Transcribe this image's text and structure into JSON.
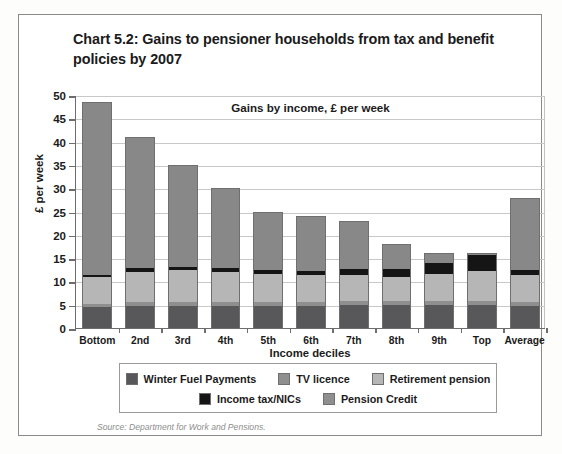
{
  "title": "Chart 5.2: Gains to pensioner households from tax and benefit policies by 2007",
  "source": "Source: Department for Work and Pensions.",
  "chart_data": {
    "type": "bar",
    "stacked": true,
    "title": "Gains by income, £ per week",
    "xlabel": "Income deciles",
    "ylabel": "£ per week",
    "ylim": [
      0,
      50
    ],
    "yticks": [
      0,
      5,
      10,
      15,
      20,
      25,
      30,
      35,
      40,
      45,
      50
    ],
    "ytick_labels": [
      "0",
      "5",
      "10",
      "15",
      "20",
      "25",
      "30",
      "35",
      "40",
      "45",
      "50"
    ],
    "grid": true,
    "legend_position": "below",
    "categories": [
      "Bottom",
      "2nd",
      "3rd",
      "4th",
      "5th",
      "6th",
      "7th",
      "8th",
      "9th",
      "Top",
      "Average"
    ],
    "series": [
      {
        "name": "Winter Fuel Payments",
        "color": "#58585a",
        "values": [
          4.5,
          4.8,
          4.8,
          4.8,
          4.8,
          4.8,
          4.9,
          4.9,
          4.9,
          5.0,
          4.8
        ]
      },
      {
        "name": "TV licence",
        "color": "#8f8f8f",
        "values": [
          0.7,
          0.8,
          0.8,
          0.8,
          0.8,
          0.8,
          0.8,
          0.8,
          0.8,
          0.8,
          0.8
        ]
      },
      {
        "name": "Pension Credit",
        "color": "#b6b6b6",
        "values": [
          5.8,
          6.5,
          6.9,
          6.4,
          5.9,
          5.8,
          5.6,
          5.3,
          5.8,
          6.5,
          5.7
        ]
      },
      {
        "name": "Income tax/NICs",
        "color": "#151515",
        "values": [
          0.3,
          0.7,
          0.7,
          0.9,
          0.9,
          0.9,
          1.3,
          1.6,
          2.4,
          3.4,
          1.1
        ]
      },
      {
        "name": "Retirement pension",
        "color": "#888888",
        "values": [
          37.2,
          28.2,
          21.8,
          17.1,
          12.6,
          11.7,
          10.4,
          5.4,
          2.1,
          0.3,
          15.6
        ]
      }
    ],
    "totals": [
      48.5,
      41.0,
      35.0,
      30.0,
      25.0,
      24.0,
      23.0,
      18.0,
      16.0,
      16.0,
      28.0
    ]
  },
  "legend": {
    "row1": [
      {
        "label": "Winter Fuel Payments",
        "color": "#58585a"
      },
      {
        "label": "TV licence",
        "color": "#8f8f8f"
      },
      {
        "label": "Retirement pension",
        "color": "#b6b6b6"
      }
    ],
    "row2": [
      {
        "label": "Income tax/NICs",
        "color": "#151515"
      },
      {
        "label": "Pension Credit",
        "color": "#8f8f8f"
      }
    ]
  }
}
